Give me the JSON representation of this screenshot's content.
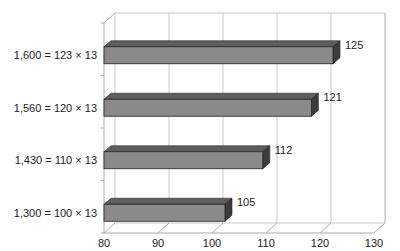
{
  "chart_data": {
    "type": "bar",
    "orientation": "horizontal",
    "style": "3d",
    "title": "",
    "xlabel": "",
    "ylabel": "",
    "categories": [
      "1,300 = 100 × 13",
      "1,430 = 110 × 13",
      "1,560 = 120 × 13",
      "1,600 = 123 × 13"
    ],
    "values": [
      105,
      112,
      121,
      125
    ],
    "data_labels": [
      "105",
      "112",
      "121",
      "125"
    ],
    "xlim": [
      80,
      130
    ],
    "xticks": [
      "80",
      "90",
      "100",
      "110",
      "120",
      "130"
    ],
    "grid": true,
    "legend": "none",
    "colors": {
      "bar_face": "#8a8a8a",
      "bar_top": "#5e5e5e",
      "bar_side": "#3c3c3c",
      "grid": "#c8c8c8",
      "axis": "#aaaaaa"
    }
  }
}
